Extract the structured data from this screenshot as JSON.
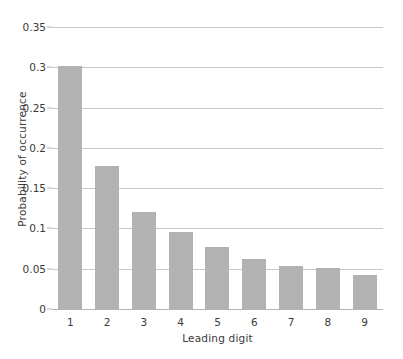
{
  "chart_data": {
    "type": "bar",
    "title": "",
    "xlabel": "Leading digit",
    "ylabel": "Probability of occurrence",
    "categories": [
      "1",
      "2",
      "3",
      "4",
      "5",
      "6",
      "7",
      "8",
      "9"
    ],
    "values": [
      0.301,
      0.178,
      0.12,
      0.095,
      0.077,
      0.062,
      0.053,
      0.051,
      0.042
    ],
    "ylim": [
      0,
      0.35
    ],
    "yticks": [
      "0",
      "0.05",
      "0.1",
      "0.15",
      "0.2",
      "0.25",
      "0.3",
      "0.35"
    ],
    "ytick_values": [
      0,
      0.05,
      0.1,
      0.15,
      0.2,
      0.25,
      0.3,
      0.35
    ],
    "grid": true,
    "legend": "none",
    "bar_color": "#b2b2b2",
    "grid_color": "#c8c8c8",
    "axis_color": "#b4b4b4",
    "background": "#ffffff"
  }
}
